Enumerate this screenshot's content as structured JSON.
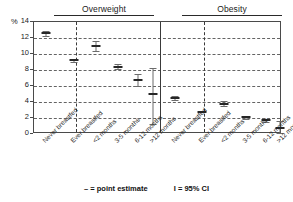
{
  "axis": {
    "y_unit": "%",
    "y_ticks": [
      "14",
      "12",
      "10",
      "8",
      "6",
      "4",
      "2",
      "0"
    ]
  },
  "legend": {
    "point_estimate": "– = point estimate",
    "confidence_interval": "I = 95% CI"
  },
  "panels": [
    {
      "title": "Overweight"
    },
    {
      "title": "Obesity"
    }
  ],
  "chart_data": {
    "type": "scatter",
    "title": "",
    "subtitle": "",
    "xlabel": "",
    "ylabel": "%",
    "ylim": [
      0,
      14
    ],
    "yticks": [
      0,
      2,
      4,
      6,
      8,
      10,
      12,
      14
    ],
    "grid": "horizontal-dashed",
    "legend_position": "bottom",
    "annotations": [
      "– = point estimate",
      "I = 95% CI"
    ],
    "categories": [
      "Never breastfed",
      "Ever breastfed",
      "<2 months",
      "3-5 months",
      "6-12 months",
      ">12 months"
    ],
    "panels": [
      {
        "name": "Overweight",
        "points": [
          {
            "category": "Never breastfed",
            "value": 12.6,
            "ci_low": 12.3,
            "ci_high": 12.9
          },
          {
            "category": "Ever breastfed",
            "value": 9.2,
            "ci_low": 9.0,
            "ci_high": 9.4
          },
          {
            "category": "<2 months",
            "value": 11.0,
            "ci_low": 10.4,
            "ci_high": 11.6
          },
          {
            "category": "3-5 months",
            "value": 8.4,
            "ci_low": 8.1,
            "ci_high": 8.8
          },
          {
            "category": "6-12 months",
            "value": 6.8,
            "ci_low": 6.0,
            "ci_high": 7.5
          },
          {
            "category": ">12 months",
            "value": 5.0,
            "ci_low": 1.2,
            "ci_high": 8.2
          }
        ]
      },
      {
        "name": "Obesity",
        "points": [
          {
            "category": "Never breastfed",
            "value": 4.5,
            "ci_low": 4.3,
            "ci_high": 4.7
          },
          {
            "category": "Ever breastfed",
            "value": 2.8,
            "ci_low": 2.7,
            "ci_high": 2.9
          },
          {
            "category": "<2 months",
            "value": 3.8,
            "ci_low": 3.5,
            "ci_high": 4.1
          },
          {
            "category": "3-5 months",
            "value": 2.1,
            "ci_low": 1.9,
            "ci_high": 2.3
          },
          {
            "category": "6-12 months",
            "value": 1.7,
            "ci_low": 1.5,
            "ci_high": 1.9
          },
          {
            "category": ">12 months",
            "value": 0.8,
            "ci_low": 0.1,
            "ci_high": 1.6
          }
        ]
      }
    ]
  }
}
